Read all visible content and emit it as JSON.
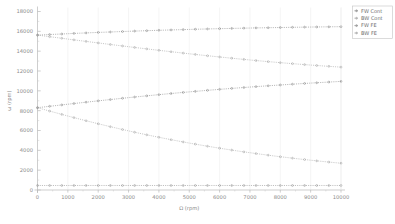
{
  "chart_data": {
    "type": "line",
    "title": "",
    "xlabel": "Ω (rpm)",
    "ylabel": "ω (rpm)",
    "xlim": [
      0,
      10000
    ],
    "ylim": [
      0,
      18000
    ],
    "xticks": [
      0,
      1000,
      2000,
      3000,
      4000,
      5000,
      6000,
      7000,
      8000,
      9000,
      10000
    ],
    "xticklabels": [
      "0",
      "1000",
      "2000",
      "3000",
      "4000",
      "5000",
      "6000",
      "7000",
      "8000",
      "9000",
      "10000"
    ],
    "yticks": [
      0,
      2000,
      4000,
      6000,
      8000,
      10000,
      12000,
      14000,
      16000,
      18000
    ],
    "yticklabels": [
      "0",
      "2000",
      "4000",
      "6000",
      "8000",
      "10000",
      "12000",
      "14000",
      "16000",
      "18000"
    ],
    "grid": "faint-vertical",
    "legend_position": "top-right",
    "x": [
      0,
      400,
      800,
      1200,
      1600,
      2000,
      2400,
      2800,
      3200,
      3600,
      4000,
      4400,
      4800,
      5200,
      5600,
      6000,
      6400,
      6800,
      7200,
      7600,
      8000,
      8400,
      8800,
      9200,
      9600,
      10000
    ],
    "series": [
      {
        "name": "FW Cont",
        "color": "#7a7a7a",
        "marker": "dot",
        "values": [
          15620,
          15680,
          15730,
          15790,
          15840,
          15890,
          15935,
          15980,
          16025,
          16065,
          16105,
          16140,
          16175,
          16210,
          16240,
          16270,
          16295,
          16320,
          16345,
          16365,
          16385,
          16405,
          16425,
          16440,
          16455,
          16470
        ]
      },
      {
        "name": "BW Cont",
        "color": "#9a9a9a",
        "marker": "dot",
        "values": [
          15620,
          15460,
          15300,
          15140,
          14985,
          14830,
          14675,
          14525,
          14375,
          14230,
          14085,
          13945,
          13805,
          13670,
          13540,
          13415,
          13290,
          13170,
          13055,
          12945,
          12840,
          12740,
          12645,
          12555,
          12470,
          12390
        ]
      },
      {
        "name": "FW FE",
        "color": "#7a7a7a",
        "marker": "dot",
        "values": [
          8300,
          8440,
          8580,
          8720,
          8855,
          8990,
          9120,
          9250,
          9375,
          9495,
          9615,
          9730,
          9840,
          9945,
          10050,
          10150,
          10245,
          10335,
          10425,
          10510,
          10590,
          10670,
          10745,
          10815,
          10885,
          10950
        ]
      },
      {
        "name": "BW FE",
        "color": "#9a9a9a",
        "marker": "dot",
        "values": [
          8300,
          7960,
          7625,
          7300,
          6985,
          6680,
          6385,
          6100,
          5825,
          5565,
          5315,
          5075,
          4845,
          4625,
          4415,
          4215,
          4025,
          3845,
          3675,
          3510,
          3355,
          3210,
          3070,
          2940,
          2815,
          2700
        ]
      },
      {
        "name": "baseline",
        "color": "#8a8a8a",
        "marker": "dot",
        "values": [
          455,
          455,
          455,
          455,
          455,
          455,
          455,
          455,
          455,
          455,
          455,
          455,
          455,
          455,
          455,
          455,
          455,
          455,
          455,
          455,
          455,
          455,
          455,
          455,
          455,
          455
        ]
      }
    ],
    "legend": [
      {
        "label": "FW Cont",
        "color": "#7a7a7a"
      },
      {
        "label": "BW Cont",
        "color": "#9a9a9a"
      },
      {
        "label": "FW FE",
        "color": "#7a7a7a"
      },
      {
        "label": "BW FE",
        "color": "#9a9a9a"
      }
    ]
  }
}
